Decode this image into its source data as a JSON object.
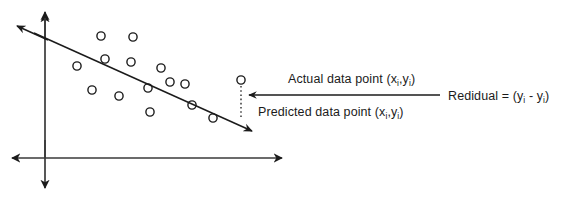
{
  "figure": {
    "background_color": "#ffffff",
    "ink_color": "#1b1b1b"
  },
  "labels": {
    "actual": {
      "prefix": "Actual data point (x",
      "sub1": "i",
      "mid": ",y",
      "sub2": "i",
      "suffix": ")"
    },
    "predicted": {
      "prefix": "Predicted data point (x",
      "sub1": "i",
      "mid": ",y",
      "sub2": "i",
      "suffix": ")"
    },
    "residual": {
      "prefix": "Redidual = (y",
      "sub1": "i",
      "mid": " - y",
      "sub2": "i",
      "suffix": ")"
    }
  },
  "axes": {
    "vertical_axis_name": "y-axis",
    "horizontal_axis_name": "x-axis",
    "origin_x": 45,
    "origin_y": 158,
    "vertical_top_y": 10,
    "vertical_bottom_y": 190,
    "horizontal_left_x": 10,
    "horizontal_right_x": 288
  },
  "regression_line": {
    "name": "fitted-regression-line",
    "x1": 20,
    "y1": 28,
    "x2": 252,
    "y2": 133
  },
  "residual_connector": {
    "name": "residual-dotted-line",
    "x": 241,
    "y_top": 80,
    "y_bottom": 116,
    "style": "dotted"
  },
  "residual_arrow": {
    "name": "residual-leader-arrow",
    "x_tail": 440,
    "x_head": 248,
    "y": 95,
    "direction": "left"
  },
  "chart_data": {
    "type": "scatter",
    "xlabel": "",
    "ylabel": "",
    "grid": false,
    "legend": false,
    "marker": "open-circle",
    "points": [
      {
        "x": 101,
        "y": 36
      },
      {
        "x": 133,
        "y": 37
      },
      {
        "x": 77,
        "y": 66
      },
      {
        "x": 105,
        "y": 59
      },
      {
        "x": 131,
        "y": 62
      },
      {
        "x": 161,
        "y": 68
      },
      {
        "x": 92,
        "y": 90
      },
      {
        "x": 119,
        "y": 96
      },
      {
        "x": 148,
        "y": 88
      },
      {
        "x": 170,
        "y": 82
      },
      {
        "x": 185,
        "y": 84
      },
      {
        "x": 150,
        "y": 112
      },
      {
        "x": 192,
        "y": 105
      },
      {
        "x": 213,
        "y": 118
      },
      {
        "x": 241,
        "y": 80
      }
    ],
    "highlighted_point": {
      "x": 241,
      "y": 80,
      "role": "actual-data-point"
    },
    "fit_line": {
      "x1": 20,
      "y1": 28,
      "x2": 252,
      "y2": 133
    }
  }
}
